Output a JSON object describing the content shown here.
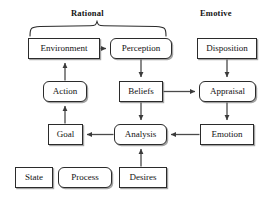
{
  "diagram": {
    "title_visible": false,
    "group_labels": [
      {
        "name": "rational",
        "text": "Rational",
        "x": 71,
        "y": 8,
        "has_brace": true
      },
      {
        "name": "emotive",
        "text": "Emotive",
        "x": 200,
        "y": 8,
        "has_brace": false
      }
    ],
    "nodes": [
      {
        "id": "environment",
        "label": "Environment",
        "shape": "state",
        "x": 28,
        "y": 38,
        "w": 72,
        "h": 21
      },
      {
        "id": "perception",
        "label": "Perception",
        "shape": "process",
        "x": 110,
        "y": 38,
        "w": 62,
        "h": 21
      },
      {
        "id": "disposition",
        "label": "Disposition",
        "shape": "state",
        "x": 197,
        "y": 38,
        "w": 60,
        "h": 21
      },
      {
        "id": "action",
        "label": "Action",
        "shape": "process",
        "x": 43,
        "y": 81,
        "w": 44,
        "h": 21
      },
      {
        "id": "beliefs",
        "label": "Beliefs",
        "shape": "state",
        "x": 119,
        "y": 81,
        "w": 44,
        "h": 21
      },
      {
        "id": "appraisal",
        "label": "Appraisal",
        "shape": "process",
        "x": 199,
        "y": 81,
        "w": 57,
        "h": 21
      },
      {
        "id": "goal",
        "label": "Goal",
        "shape": "state",
        "x": 48,
        "y": 124,
        "w": 35,
        "h": 21
      },
      {
        "id": "analysis",
        "label": "Analysis",
        "shape": "process",
        "x": 114,
        "y": 124,
        "w": 53,
        "h": 21
      },
      {
        "id": "emotion",
        "label": "Emotion",
        "shape": "state",
        "x": 200,
        "y": 124,
        "w": 54,
        "h": 21
      },
      {
        "id": "state",
        "label": "State",
        "shape": "state",
        "x": 15,
        "y": 167,
        "w": 38,
        "h": 21
      },
      {
        "id": "process",
        "label": "Process",
        "shape": "process",
        "x": 58,
        "y": 167,
        "w": 54,
        "h": 21
      },
      {
        "id": "desires",
        "label": "Desires",
        "shape": "state",
        "x": 119,
        "y": 167,
        "w": 48,
        "h": 21
      }
    ],
    "edges": [
      {
        "id": "environment-to-perception",
        "from": "environment",
        "to": "perception",
        "direction": "right"
      },
      {
        "id": "perception-to-beliefs",
        "from": "perception",
        "to": "beliefs",
        "direction": "down"
      },
      {
        "id": "beliefs-to-analysis",
        "from": "beliefs",
        "to": "analysis",
        "direction": "down"
      },
      {
        "id": "beliefs-to-appraisal",
        "from": "beliefs",
        "to": "appraisal",
        "direction": "right"
      },
      {
        "id": "disposition-to-appraisal",
        "from": "disposition",
        "to": "appraisal",
        "direction": "down"
      },
      {
        "id": "appraisal-to-emotion",
        "from": "appraisal",
        "to": "emotion",
        "direction": "down"
      },
      {
        "id": "emotion-to-analysis",
        "from": "emotion",
        "to": "analysis",
        "direction": "left"
      },
      {
        "id": "desires-to-analysis",
        "from": "desires",
        "to": "analysis",
        "direction": "up"
      },
      {
        "id": "analysis-to-goal",
        "from": "analysis",
        "to": "goal",
        "direction": "left"
      },
      {
        "id": "goal-to-action",
        "from": "goal",
        "to": "action",
        "direction": "up"
      },
      {
        "id": "action-to-environment",
        "from": "action",
        "to": "environment",
        "direction": "up"
      }
    ],
    "colors": {
      "background": "#ffffff",
      "box_border": "#2b2b2b",
      "box_fill": "#ffffff",
      "text": "#121212",
      "edge": "#4a4a4a",
      "brace": "#2b2b2b"
    }
  }
}
